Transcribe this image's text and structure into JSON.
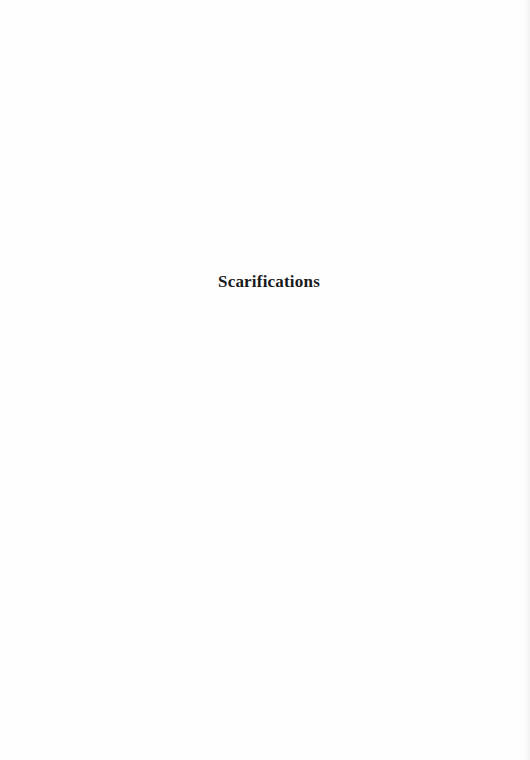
{
  "page": {
    "title": "Scarifications",
    "background_color": "#fefefe",
    "text_color": "#1a1a1a"
  }
}
